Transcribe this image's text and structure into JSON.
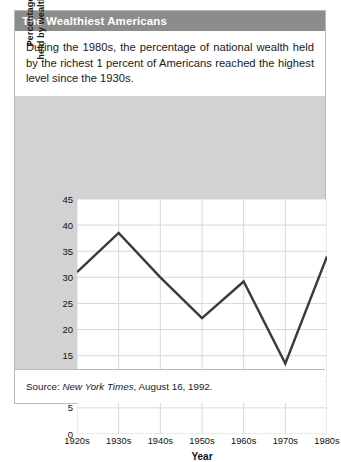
{
  "header": {
    "title": "The Wealthiest Americans"
  },
  "intro": {
    "text": "During the 1980s, the percentage of national wealth held by the richest 1 percent of Americans reached the highest level since the 1930s."
  },
  "source": {
    "prefix": "Source: ",
    "publication": "New York Times",
    "suffix": ", August 16, 1992."
  },
  "chart_data": {
    "type": "line",
    "title": "",
    "xlabel": "Year",
    "ylabel_line1": "Percentage of national wealth",
    "ylabel_line2": "held by wealthiest 1% of Americans",
    "categories": [
      "1920s",
      "1930s",
      "1940s",
      "1950s",
      "1960s",
      "1970s",
      "1980s"
    ],
    "values": [
      31,
      38.5,
      30,
      22.2,
      29.2,
      13.5,
      34
    ],
    "ylim": [
      0,
      45
    ],
    "ytick_values": [
      0,
      5,
      10,
      15,
      20,
      25,
      30,
      35,
      40,
      45
    ],
    "grid": true,
    "legend": "none",
    "line_color": "#3a3a3a",
    "plot_background": "#ffffff",
    "grid_color": "#d8d8d8",
    "panel_background": "#d2d2d2"
  }
}
